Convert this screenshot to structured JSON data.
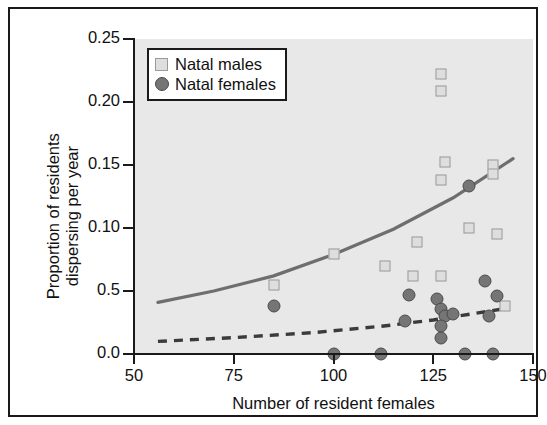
{
  "chart_data": {
    "type": "scatter",
    "title": "",
    "xlabel": "Number of resident females",
    "ylabel": "Proportion of residents dispersing per year",
    "ylabel_line1": "Proportion of residents",
    "ylabel_line2": "dispersing per year",
    "xlim": [
      50,
      150
    ],
    "ylim": [
      0.0,
      0.25
    ],
    "xticks": [
      50,
      75,
      100,
      125,
      150
    ],
    "xtick_labels": [
      "50",
      "75",
      "100",
      "125",
      "150"
    ],
    "yticks": [
      0.0,
      0.05,
      0.1,
      0.15,
      0.2,
      0.25
    ],
    "ytick_labels": [
      "0.0",
      "0.5",
      "0.10",
      "0.15",
      "0.20",
      "0.25"
    ],
    "grid": false,
    "legend_position": "top-left",
    "panel_color": "#e8e8e8",
    "series": [
      {
        "name": "Natal males",
        "marker": "open-square",
        "color": "#dedede",
        "edge_color": "#9a9a9a",
        "points": [
          {
            "x": 85,
            "y": 0.055
          },
          {
            "x": 100,
            "y": 0.079
          },
          {
            "x": 113,
            "y": 0.07
          },
          {
            "x": 121,
            "y": 0.089
          },
          {
            "x": 120,
            "y": 0.062
          },
          {
            "x": 127,
            "y": 0.062
          },
          {
            "x": 127,
            "y": 0.222
          },
          {
            "x": 127,
            "y": 0.209
          },
          {
            "x": 128,
            "y": 0.152
          },
          {
            "x": 127,
            "y": 0.138
          },
          {
            "x": 140,
            "y": 0.15
          },
          {
            "x": 140,
            "y": 0.143
          },
          {
            "x": 134,
            "y": 0.1
          },
          {
            "x": 141,
            "y": 0.095
          },
          {
            "x": 143,
            "y": 0.038
          }
        ]
      },
      {
        "name": "Natal females",
        "marker": "filled-circle",
        "color": "#757575",
        "edge_color": "#4a4a4a",
        "points": [
          {
            "x": 85,
            "y": 0.038
          },
          {
            "x": 100,
            "y": 0.0
          },
          {
            "x": 112,
            "y": 0.0
          },
          {
            "x": 119,
            "y": 0.047
          },
          {
            "x": 118,
            "y": 0.026
          },
          {
            "x": 126,
            "y": 0.044
          },
          {
            "x": 127,
            "y": 0.036
          },
          {
            "x": 128,
            "y": 0.03
          },
          {
            "x": 127,
            "y": 0.022
          },
          {
            "x": 127,
            "y": 0.013
          },
          {
            "x": 130,
            "y": 0.032
          },
          {
            "x": 133,
            "y": 0.0
          },
          {
            "x": 134,
            "y": 0.133
          },
          {
            "x": 140,
            "y": 0.0
          },
          {
            "x": 138,
            "y": 0.058
          },
          {
            "x": 141,
            "y": 0.046
          },
          {
            "x": 139,
            "y": 0.03
          }
        ]
      }
    ],
    "fitted_curves": [
      {
        "name": "males-fit",
        "style": "solid",
        "color": "#6e6e6e",
        "x_range": [
          56,
          145
        ],
        "points": [
          {
            "x": 56,
            "y": 0.041
          },
          {
            "x": 70,
            "y": 0.05
          },
          {
            "x": 85,
            "y": 0.062
          },
          {
            "x": 100,
            "y": 0.079
          },
          {
            "x": 115,
            "y": 0.099
          },
          {
            "x": 130,
            "y": 0.124
          },
          {
            "x": 145,
            "y": 0.155
          }
        ]
      },
      {
        "name": "females-fit",
        "style": "dashed",
        "color": "#3b3b3b",
        "x_range": [
          56,
          143
        ],
        "points": [
          {
            "x": 56,
            "y": 0.01
          },
          {
            "x": 75,
            "y": 0.013
          },
          {
            "x": 95,
            "y": 0.017
          },
          {
            "x": 112,
            "y": 0.022
          },
          {
            "x": 125,
            "y": 0.027
          },
          {
            "x": 135,
            "y": 0.032
          },
          {
            "x": 143,
            "y": 0.036
          }
        ]
      }
    ]
  },
  "legend": {
    "items": [
      {
        "label": "Natal males",
        "marker": "open-square"
      },
      {
        "label": "Natal females",
        "marker": "filled-circle"
      }
    ]
  }
}
